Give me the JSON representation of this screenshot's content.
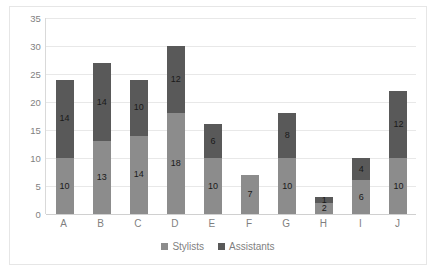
{
  "chart_data": {
    "type": "bar",
    "subtype": "stacked-column",
    "title": "",
    "xlabel": "",
    "ylabel": "",
    "categories": [
      "A",
      "B",
      "C",
      "D",
      "E",
      "F",
      "G",
      "H",
      "I",
      "J"
    ],
    "series": [
      {
        "name": "Stylists",
        "color": "#8c8c8c",
        "values": [
          10,
          13,
          14,
          18,
          10,
          7,
          10,
          2,
          6,
          10
        ]
      },
      {
        "name": "Assistants",
        "color": "#595959",
        "values": [
          14,
          14,
          10,
          12,
          6,
          0,
          8,
          1,
          4,
          12
        ]
      }
    ],
    "totals": [
      24,
      27,
      24,
      30,
      16,
      7,
      18,
      3,
      10,
      22
    ],
    "ylim": [
      0,
      35
    ],
    "ytick_step": 5,
    "yticks": [
      "0",
      "5",
      "10",
      "15",
      "20",
      "25",
      "30",
      "35"
    ],
    "grid": true,
    "grid_axis": "y",
    "legend_position": "bottom",
    "legend": [
      "Stylists",
      "Assistants"
    ],
    "data_labels": true,
    "plot_background": "#ffffff",
    "gridline_color": "#e8e8e8",
    "axis_color": "#d9d9d9",
    "tick_label_color": "#7f7f7f",
    "border_color": "#e6e6e6"
  }
}
